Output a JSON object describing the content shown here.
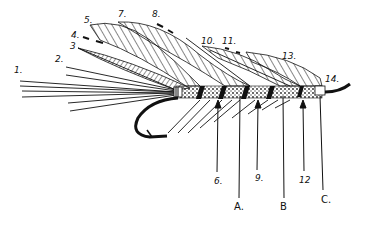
{
  "diagram": {
    "ink_color": "#111111",
    "background": "#ffffff",
    "labels": [
      {
        "id": "1",
        "text": "1.",
        "x": 16,
        "y": 70
      },
      {
        "id": "2",
        "text": "2.",
        "x": 55,
        "y": 58
      },
      {
        "id": "3",
        "text": "3",
        "x": 71,
        "y": 44
      },
      {
        "id": "4",
        "text": "4.",
        "x": 71,
        "y": 33
      },
      {
        "id": "5",
        "text": "5.",
        "x": 84,
        "y": 18
      },
      {
        "id": "7",
        "text": "7.",
        "x": 118,
        "y": 12
      },
      {
        "id": "8",
        "text": "8.",
        "x": 153,
        "y": 12
      },
      {
        "id": "10",
        "text": "10.",
        "x": 203,
        "y": 38
      },
      {
        "id": "11",
        "text": "11.",
        "x": 222,
        "y": 38
      },
      {
        "id": "13",
        "text": "13.",
        "x": 282,
        "y": 53
      },
      {
        "id": "14",
        "text": "14.",
        "x": 325,
        "y": 77
      },
      {
        "id": "6",
        "text": "6.",
        "x": 215,
        "y": 178
      },
      {
        "id": "9",
        "text": "9.",
        "x": 256,
        "y": 175
      },
      {
        "id": "12",
        "text": "12",
        "x": 300,
        "y": 177
      },
      {
        "id": "A",
        "text": "A.",
        "x": 234,
        "y": 204
      },
      {
        "id": "B",
        "text": "B",
        "x": 280,
        "y": 204
      },
      {
        "id": "C",
        "text": "C.",
        "x": 322,
        "y": 196
      }
    ]
  }
}
